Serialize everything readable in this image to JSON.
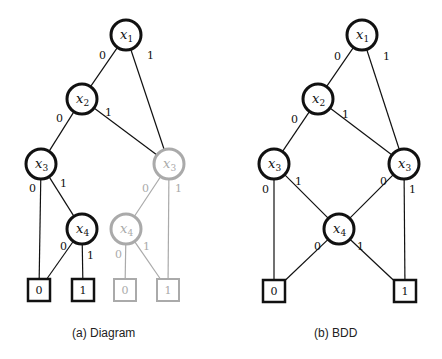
{
  "colors": {
    "active": "#111111",
    "faded": "#aaaaaa",
    "background": "#ffffff"
  },
  "captions": {
    "left": "(a) Diagram",
    "right": "(b) BDD"
  },
  "diagrams": [
    {
      "id": "decision-tree",
      "caption": "(a) Diagram",
      "nodes": [
        {
          "id": "x1",
          "var": "x",
          "sub": "1",
          "cx": 126,
          "cy": 35,
          "faded": false
        },
        {
          "id": "x2",
          "var": "x",
          "sub": "2",
          "cx": 82,
          "cy": 99,
          "faded": false
        },
        {
          "id": "x3a",
          "var": "x",
          "sub": "3",
          "cx": 41,
          "cy": 164,
          "faded": false
        },
        {
          "id": "x3b",
          "var": "x",
          "sub": "3",
          "cx": 169,
          "cy": 164,
          "faded": true
        },
        {
          "id": "x4a",
          "var": "x",
          "sub": "4",
          "cx": 82,
          "cy": 229,
          "faded": false
        },
        {
          "id": "x4b",
          "var": "x",
          "sub": "4",
          "cx": 126,
          "cy": 229,
          "faded": true
        }
      ],
      "terminals": [
        {
          "id": "t0a",
          "value": "0",
          "cx": 39,
          "cy": 290,
          "faded": false
        },
        {
          "id": "t1a",
          "value": "1",
          "cx": 83,
          "cy": 290,
          "faded": false
        },
        {
          "id": "t0b",
          "value": "0",
          "cx": 125,
          "cy": 290,
          "faded": true
        },
        {
          "id": "t1b",
          "value": "1",
          "cx": 168,
          "cy": 290,
          "faded": true
        }
      ],
      "edges": [
        {
          "from": "x1",
          "to": "x2",
          "label": "0",
          "lx": 99,
          "ly": 59,
          "faded": false
        },
        {
          "from": "x1",
          "to": "x3b",
          "label": "1",
          "lx": 147,
          "ly": 59,
          "faded": false
        },
        {
          "from": "x2",
          "to": "x3a",
          "label": "0",
          "lx": 56,
          "ly": 122,
          "faded": false
        },
        {
          "from": "x2",
          "to": "x3b",
          "label": "1",
          "lx": 105,
          "ly": 116,
          "faded": false
        },
        {
          "from": "x3a",
          "to": "t0a",
          "label": "0",
          "lx": 29,
          "ly": 192,
          "faded": false
        },
        {
          "from": "x3a",
          "to": "x4a",
          "label": "1",
          "lx": 60,
          "ly": 187,
          "faded": false
        },
        {
          "from": "x4a",
          "to": "t0a",
          "label": "0",
          "lx": 60,
          "ly": 250,
          "faded": false
        },
        {
          "from": "x4a",
          "to": "t1a",
          "label": "1",
          "lx": 87,
          "ly": 259,
          "faded": false
        },
        {
          "from": "x3b",
          "to": "x4b",
          "label": "0",
          "lx": 142,
          "ly": 192,
          "faded": true
        },
        {
          "from": "x3b",
          "to": "t1b",
          "label": "1",
          "lx": 175,
          "ly": 192,
          "faded": true
        },
        {
          "from": "x4b",
          "to": "t0b",
          "label": "0",
          "lx": 115,
          "ly": 258,
          "faded": true
        },
        {
          "from": "x4b",
          "to": "t1b",
          "label": "1",
          "lx": 143,
          "ly": 250,
          "faded": true
        }
      ]
    },
    {
      "id": "bdd",
      "caption": "(b) BDD",
      "nodes": [
        {
          "id": "x1",
          "var": "x",
          "sub": "1",
          "cx": 362,
          "cy": 35,
          "faded": false
        },
        {
          "id": "x2",
          "var": "x",
          "sub": "2",
          "cx": 318,
          "cy": 99,
          "faded": false
        },
        {
          "id": "x3a",
          "var": "x",
          "sub": "3",
          "cx": 274,
          "cy": 164,
          "faded": false
        },
        {
          "id": "x3b",
          "var": "x",
          "sub": "3",
          "cx": 404,
          "cy": 164,
          "faded": false
        },
        {
          "id": "x4",
          "var": "x",
          "sub": "4",
          "cx": 339,
          "cy": 229,
          "faded": false
        }
      ],
      "terminals": [
        {
          "id": "t0",
          "value": "0",
          "cx": 274,
          "cy": 291,
          "faded": false
        },
        {
          "id": "t1",
          "value": "1",
          "cx": 405,
          "cy": 291,
          "faded": false
        }
      ],
      "edges": [
        {
          "from": "x1",
          "to": "x2",
          "label": "0",
          "lx": 334,
          "ly": 60,
          "faded": false
        },
        {
          "from": "x1",
          "to": "x3b",
          "label": "1",
          "lx": 383,
          "ly": 60,
          "faded": false
        },
        {
          "from": "x2",
          "to": "x3a",
          "label": "0",
          "lx": 291,
          "ly": 123,
          "faded": false
        },
        {
          "from": "x2",
          "to": "x3b",
          "label": "1",
          "lx": 342,
          "ly": 118,
          "faded": false
        },
        {
          "from": "x3a",
          "to": "t0",
          "label": "0",
          "lx": 262,
          "ly": 193,
          "faded": false
        },
        {
          "from": "x3a",
          "to": "x4",
          "label": "1",
          "lx": 295,
          "ly": 185,
          "faded": false
        },
        {
          "from": "x3b",
          "to": "x4",
          "label": "0",
          "lx": 380,
          "ly": 185,
          "faded": false
        },
        {
          "from": "x3b",
          "to": "t1",
          "label": "1",
          "lx": 409,
          "ly": 193,
          "faded": false
        },
        {
          "from": "x4",
          "to": "t0",
          "label": "0",
          "lx": 314,
          "ly": 250,
          "faded": false
        },
        {
          "from": "x4",
          "to": "t1",
          "label": "1",
          "lx": 357,
          "ly": 250,
          "faded": false
        }
      ]
    }
  ]
}
